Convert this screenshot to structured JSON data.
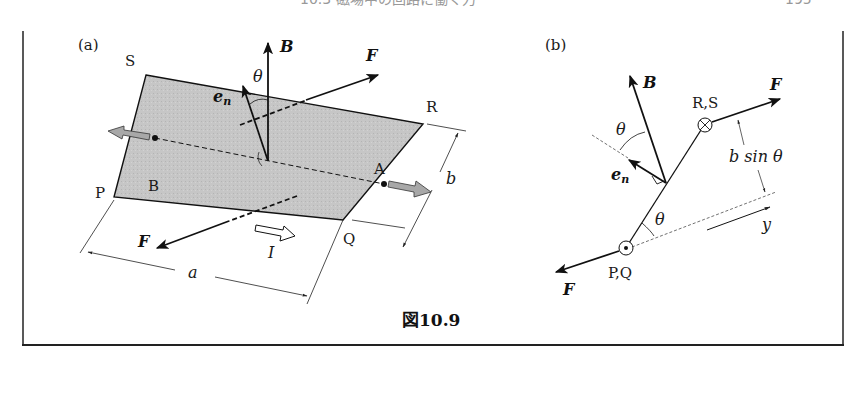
{
  "page_header": {
    "text": "10.3 磁場中の回路に働く力",
    "page_number": "195"
  },
  "figure": {
    "caption": "図10.9",
    "panel_a": {
      "tag": "(a)",
      "corners": {
        "P": "P",
        "Q": "Q",
        "R": "R",
        "S": "S"
      },
      "points": {
        "A": "A",
        "B": "B"
      },
      "vectors": {
        "field": "B",
        "normal": "e",
        "normal_sub": "n",
        "force_top": "F",
        "force_bottom": "F"
      },
      "angle": "θ",
      "current": "I",
      "dim_a": "a",
      "dim_b": "b"
    },
    "panel_b": {
      "tag": "(b)",
      "ends": {
        "top": "R,S",
        "bottom": "P,Q"
      },
      "vectors": {
        "field": "B",
        "normal": "e",
        "normal_sub": "n",
        "force_top": "F",
        "force_bottom": "F"
      },
      "angle_top": "θ",
      "angle_bottom": "θ",
      "lever_arm": "b sin θ",
      "axis": "y"
    }
  },
  "colors": {
    "plate_fill": "#c8c8c8",
    "ink": "#111111",
    "gray_arrow": "#a8a8a8",
    "frame": "#222222"
  }
}
